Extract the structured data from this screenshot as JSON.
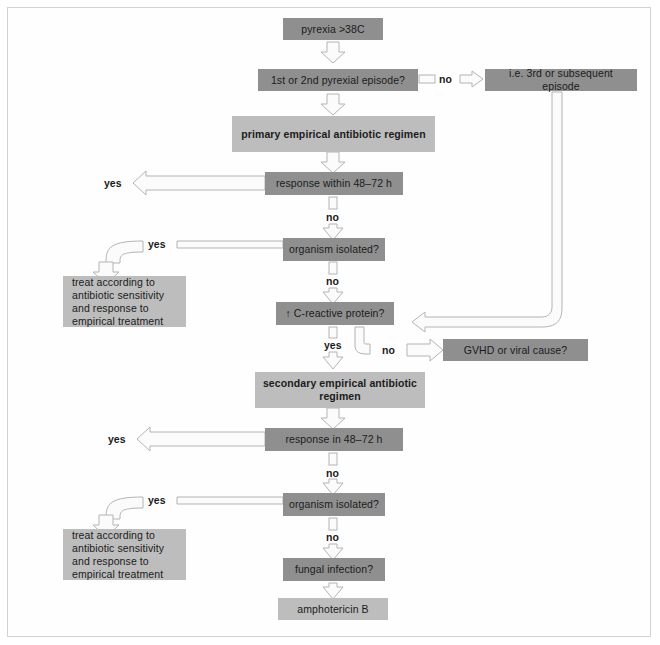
{
  "diagram": {
    "colors": {
      "node_dark": "#8f8f8f",
      "node_light": "#bdbdbd",
      "arrow_fill": "#fbfbfb",
      "arrow_stroke": "#b4b4b4",
      "text": "#1b1b1b",
      "frame": "#d2d2d2",
      "background": "#ffffff"
    },
    "nodes": {
      "pyrexia": "pyrexia  >38C",
      "episode_question": "1st or 2nd pyrexial episode?",
      "third_episode": "i.e. 3rd or subsequent episode",
      "primary_regimen": "primary empirical antibiotic regimen",
      "response_1": "response within 48–72 h",
      "organism_1": "organism isolated?",
      "treat_1": "treat according to antibiotic sensitivity and response to empirical treatment",
      "crp": "↑ C-reactive protein?",
      "gvhd": "GVHD or viral cause?",
      "secondary_regimen": "secondary empirical antibiotic regimen",
      "response_2": "response in 48–72 h",
      "organism_2": "organism isolated?",
      "treat_2": "treat according to antibiotic sensitivity and response to empirical treatment",
      "fungal": "fungal infection?",
      "amphotericin": "amphotericin B"
    },
    "edge_labels": {
      "episode_no": "no",
      "response_1_yes": "yes",
      "response_1_no": "no",
      "organism_1_yes": "yes",
      "organism_1_no": "no",
      "crp_yes": "yes",
      "crp_no": "no",
      "response_2_yes": "yes",
      "response_2_no": "no",
      "organism_2_yes": "yes",
      "organism_2_no": "no"
    }
  }
}
